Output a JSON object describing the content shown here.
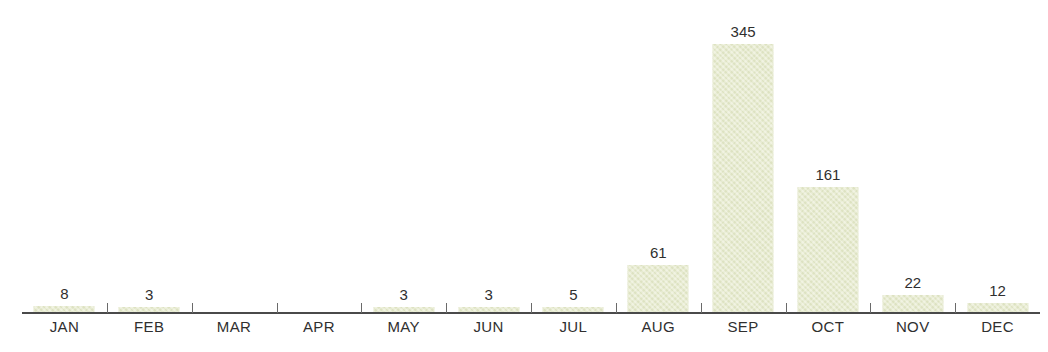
{
  "chart_data": {
    "type": "bar",
    "title": "",
    "subtitle": "",
    "xlabel": "",
    "ylabel": "",
    "categories": [
      "JAN",
      "FEB",
      "MAR",
      "APR",
      "MAY",
      "JUN",
      "JUL",
      "AUG",
      "SEP",
      "OCT",
      "NOV",
      "DEC"
    ],
    "values": [
      8,
      3,
      0,
      0,
      3,
      3,
      5,
      61,
      345,
      161,
      22,
      12
    ],
    "value_labels": [
      "8",
      "3",
      "",
      "",
      "3",
      "3",
      "5",
      "61",
      "345",
      "161",
      "22",
      "12"
    ],
    "ylim": [
      0,
      345
    ],
    "grid": false,
    "legend": null,
    "bar_color": "#e3e8c6",
    "axis_color": "#4a4a4a",
    "label_color": "#2f2f2f"
  },
  "axis": {
    "tick_count": 11
  }
}
